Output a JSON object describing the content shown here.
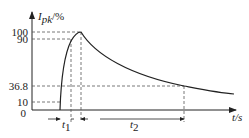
{
  "diagram": {
    "y_axis_label": "I",
    "y_axis_sub": "pk",
    "y_axis_unit": "/%",
    "x_axis_label": "t/s",
    "origin_label": "0",
    "y_ticks": [
      "100",
      "90",
      "36.8",
      "10"
    ],
    "intervals": [
      {
        "label": "t",
        "sub": "1"
      },
      {
        "label": "t",
        "sub": "2"
      }
    ],
    "colors": {
      "line": "#222222",
      "dash": "#555555"
    }
  }
}
